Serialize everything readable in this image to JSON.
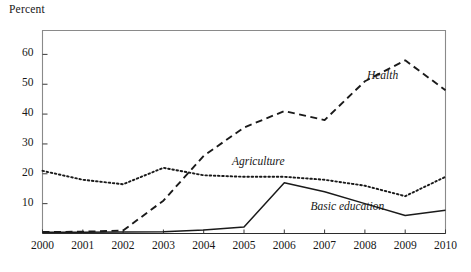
{
  "chart_data": {
    "type": "line",
    "title": "",
    "xlabel": "",
    "ylabel": "Percent",
    "x": [
      2000,
      2001,
      2002,
      2003,
      2004,
      2005,
      2006,
      2007,
      2008,
      2009,
      2010
    ],
    "categories": [
      "2000",
      "2001",
      "2002",
      "2003",
      "2004",
      "2005",
      "2006",
      "2007",
      "2008",
      "2009",
      "2010"
    ],
    "xlim": [
      2000,
      2010
    ],
    "ylim": [
      0,
      68
    ],
    "yticks": [
      10,
      20,
      30,
      40,
      50,
      60
    ],
    "ytick_labels": [
      "10",
      "20",
      "30",
      "40",
      "50",
      "60"
    ],
    "grid": false,
    "legend": "inline-annotations",
    "series": [
      {
        "name": "Health",
        "style": "dashed",
        "color": "#1a1a1a",
        "values": [
          0.5,
          0.6,
          1.0,
          11.0,
          26.0,
          35.5,
          41.0,
          38.0,
          51.0,
          58.0,
          48.0
        ]
      },
      {
        "name": "Agriculture",
        "style": "dotted",
        "color": "#1a1a1a",
        "values": [
          21.0,
          18.0,
          16.5,
          22.0,
          19.5,
          19.0,
          19.0,
          18.0,
          16.0,
          12.5,
          19.0
        ]
      },
      {
        "name": "Basic education",
        "style": "solid",
        "color": "#1a1a1a",
        "values": [
          0.4,
          0.4,
          0.5,
          0.6,
          1.2,
          2.2,
          17.0,
          14.0,
          10.0,
          6.0,
          7.8
        ]
      }
    ],
    "annotations": [
      {
        "text": "Health",
        "x": 2008.05,
        "y": 52.5
      },
      {
        "text": "Agriculture",
        "x": 2004.7,
        "y": 23.5
      },
      {
        "text": "Basic education",
        "x": 2006.65,
        "y": 8.5
      }
    ]
  }
}
